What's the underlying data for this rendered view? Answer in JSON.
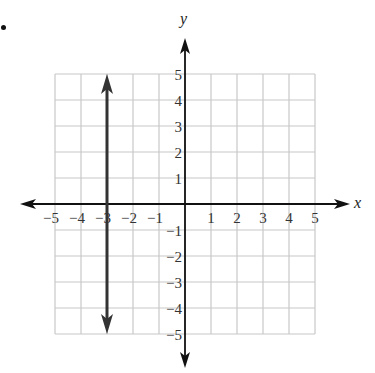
{
  "marker": "•",
  "chart_data": {
    "type": "line",
    "title": "",
    "xlabel": "x",
    "ylabel": "y",
    "xlim": [
      -5,
      5
    ],
    "ylim": [
      -5,
      5
    ],
    "grid": true,
    "x_ticks": [
      "−5",
      "−4",
      "−3",
      "−2",
      "−1",
      "1",
      "2",
      "3",
      "4",
      "5"
    ],
    "y_ticks": [
      "5",
      "4",
      "3",
      "2",
      "1",
      "−1",
      "−2",
      "−3",
      "−4",
      "−5"
    ],
    "series": [
      {
        "name": "x = -3",
        "kind": "vertical line with arrows at both ends",
        "x": [
          -3,
          -3
        ],
        "y": [
          -5,
          5
        ]
      }
    ],
    "colors": {
      "grid": "#c8c8c8",
      "axis": "#111111",
      "line": "#333333"
    }
  }
}
